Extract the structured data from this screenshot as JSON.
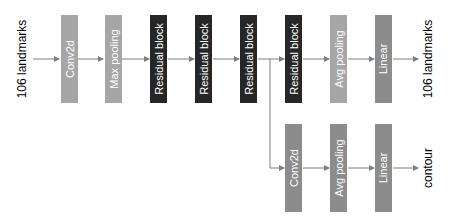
{
  "diagram": {
    "input_label": "106 landmarks",
    "main_branch": [
      {
        "label": "Conv2d",
        "color": "#a6a6a6"
      },
      {
        "label": "Max pooling",
        "color": "#a6a6a6"
      },
      {
        "label": "Residual block",
        "color": "#262626"
      },
      {
        "label": "Residual block",
        "color": "#262626"
      },
      {
        "label": "Residual block",
        "color": "#262626"
      },
      {
        "label": "Residual block",
        "color": "#262626"
      },
      {
        "label": "Avg pooling",
        "color": "#a6a6a6"
      },
      {
        "label": "Linear",
        "color": "#8c8c8c"
      }
    ],
    "main_output_label": "106 landmarks",
    "contour_branch": [
      {
        "label": "Conv2d",
        "color": "#8c8c8c"
      },
      {
        "label": "Avg pooling",
        "color": "#8c8c8c"
      },
      {
        "label": "Linear",
        "color": "#8c8c8c"
      }
    ],
    "contour_output_label": "contour"
  }
}
